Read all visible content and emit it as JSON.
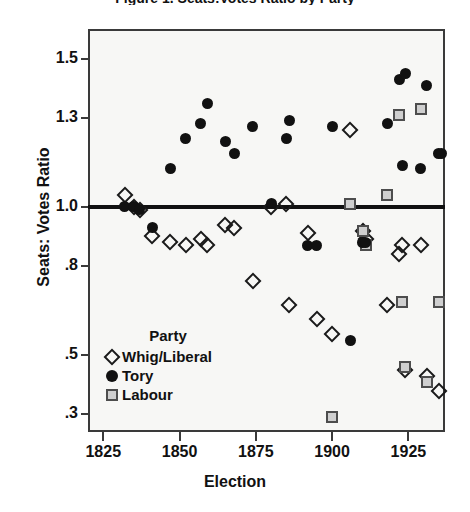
{
  "chart_data": {
    "type": "scatter",
    "title": "Figure 1. Seats:Votes Ratio by Party",
    "xlabel": "Election",
    "ylabel": "Seats: Votes Ratio",
    "xlim": [
      1820,
      1937
    ],
    "ylim": [
      0.24,
      1.6
    ],
    "xticks": [
      1825,
      1850,
      1875,
      1900,
      1925
    ],
    "xticklabels": [
      "1825",
      "1850",
      "1875",
      "1900",
      "1925"
    ],
    "yticks": [
      1.5,
      1.3,
      1.0,
      0.8,
      0.5,
      0.3
    ],
    "yticklabels": [
      "1.5",
      "1.3",
      "1.0",
      ".8",
      ".5",
      ".3"
    ],
    "grid": false,
    "reference_line": 1.0,
    "legend": {
      "title": "Party",
      "position": "inside-lower-left",
      "entries": [
        {
          "label": "Whig/Liberal",
          "marker": "open-diamond",
          "color": "#1a1a1a"
        },
        {
          "label": "Tory",
          "marker": "filled-circle",
          "color": "#111111"
        },
        {
          "label": "Labour",
          "marker": "gray-square",
          "color": "#cfcfcf"
        }
      ]
    },
    "series": [
      {
        "name": "Whig/Liberal",
        "marker": "open-diamond",
        "points": [
          {
            "x": 1832,
            "y": 1.04
          },
          {
            "x": 1835,
            "y": 1.0
          },
          {
            "x": 1837,
            "y": 0.99
          },
          {
            "x": 1841,
            "y": 0.9
          },
          {
            "x": 1847,
            "y": 0.88
          },
          {
            "x": 1852,
            "y": 0.87
          },
          {
            "x": 1857,
            "y": 0.89
          },
          {
            "x": 1859,
            "y": 0.87
          },
          {
            "x": 1865,
            "y": 0.94
          },
          {
            "x": 1868,
            "y": 0.93
          },
          {
            "x": 1874,
            "y": 0.75
          },
          {
            "x": 1880,
            "y": 1.0
          },
          {
            "x": 1885,
            "y": 1.01
          },
          {
            "x": 1886,
            "y": 0.67
          },
          {
            "x": 1892,
            "y": 0.91
          },
          {
            "x": 1895,
            "y": 0.62
          },
          {
            "x": 1900,
            "y": 0.57
          },
          {
            "x": 1906,
            "y": 1.26
          },
          {
            "x": 1910,
            "y": 0.92
          },
          {
            "x": 1911,
            "y": 0.89
          },
          {
            "x": 1918,
            "y": 0.67
          },
          {
            "x": 1922,
            "y": 0.84
          },
          {
            "x": 1923,
            "y": 0.87
          },
          {
            "x": 1924,
            "y": 0.45
          },
          {
            "x": 1929,
            "y": 0.87
          },
          {
            "x": 1931,
            "y": 0.43
          },
          {
            "x": 1935,
            "y": 0.38
          }
        ]
      },
      {
        "name": "Tory",
        "marker": "filled-circle",
        "points": [
          {
            "x": 1832,
            "y": 1.0
          },
          {
            "x": 1835,
            "y": 1.0
          },
          {
            "x": 1837,
            "y": 0.99
          },
          {
            "x": 1841,
            "y": 0.93
          },
          {
            "x": 1847,
            "y": 1.13
          },
          {
            "x": 1852,
            "y": 1.23
          },
          {
            "x": 1857,
            "y": 1.28
          },
          {
            "x": 1859,
            "y": 1.35
          },
          {
            "x": 1865,
            "y": 1.22
          },
          {
            "x": 1868,
            "y": 1.18
          },
          {
            "x": 1874,
            "y": 1.27
          },
          {
            "x": 1880,
            "y": 1.01
          },
          {
            "x": 1885,
            "y": 1.23
          },
          {
            "x": 1886,
            "y": 1.29
          },
          {
            "x": 1892,
            "y": 0.87
          },
          {
            "x": 1895,
            "y": 0.87
          },
          {
            "x": 1900,
            "y": 1.27
          },
          {
            "x": 1906,
            "y": 0.55
          },
          {
            "x": 1910,
            "y": 0.88
          },
          {
            "x": 1911,
            "y": 0.88
          },
          {
            "x": 1918,
            "y": 1.28
          },
          {
            "x": 1922,
            "y": 1.43
          },
          {
            "x": 1923,
            "y": 1.14
          },
          {
            "x": 1924,
            "y": 1.45
          },
          {
            "x": 1929,
            "y": 1.13
          },
          {
            "x": 1931,
            "y": 1.41
          },
          {
            "x": 1935,
            "y": 1.18
          },
          {
            "x": 1936,
            "y": 1.18
          }
        ]
      },
      {
        "name": "Labour",
        "marker": "gray-square",
        "points": [
          {
            "x": 1900,
            "y": 0.29
          },
          {
            "x": 1906,
            "y": 1.01
          },
          {
            "x": 1910,
            "y": 0.92
          },
          {
            "x": 1911,
            "y": 0.87
          },
          {
            "x": 1918,
            "y": 1.04
          },
          {
            "x": 1922,
            "y": 1.31
          },
          {
            "x": 1923,
            "y": 0.68
          },
          {
            "x": 1924,
            "y": 0.46
          },
          {
            "x": 1929,
            "y": 1.33
          },
          {
            "x": 1931,
            "y": 0.41
          },
          {
            "x": 1935,
            "y": 0.68
          }
        ]
      }
    ]
  }
}
